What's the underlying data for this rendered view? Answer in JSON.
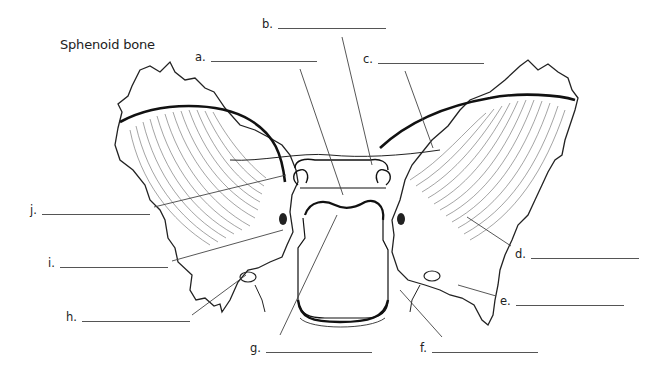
{
  "title": "Sphenoid bone",
  "labels": [
    {
      "id": "a",
      "text": "a.",
      "x": 195,
      "y": 50,
      "blank_width": 106
    },
    {
      "id": "b",
      "text": "b.",
      "x": 262,
      "y": 17,
      "blank_width": 108
    },
    {
      "id": "c",
      "text": "c.",
      "x": 363,
      "y": 52,
      "blank_width": 106
    },
    {
      "id": "d",
      "text": "d.",
      "x": 515,
      "y": 247,
      "blank_width": 108
    },
    {
      "id": "e",
      "text": "e.",
      "x": 500,
      "y": 294,
      "blank_width": 108
    },
    {
      "id": "f",
      "text": "f.",
      "x": 420,
      "y": 341,
      "blank_width": 106
    },
    {
      "id": "g",
      "text": "g.",
      "x": 250,
      "y": 341,
      "blank_width": 106
    },
    {
      "id": "h",
      "text": "h.",
      "x": 66,
      "y": 310,
      "blank_width": 108
    },
    {
      "id": "i",
      "text": "i.",
      "x": 48,
      "y": 256,
      "blank_width": 108
    },
    {
      "id": "j",
      "text": "j.",
      "x": 30,
      "y": 203,
      "blank_width": 108
    }
  ],
  "leader_lines": [
    {
      "label": "a",
      "x1": 300,
      "y1": 69,
      "x2": 343,
      "y2": 195
    },
    {
      "label": "b",
      "x1": 342,
      "y1": 37,
      "x2": 372,
      "y2": 165
    },
    {
      "label": "c",
      "x1": 405,
      "y1": 71,
      "x2": 433,
      "y2": 148
    },
    {
      "label": "d",
      "x1": 467,
      "y1": 217,
      "x2": 511,
      "y2": 246
    },
    {
      "label": "e",
      "x1": 458,
      "y1": 285,
      "x2": 496,
      "y2": 296
    },
    {
      "label": "f",
      "x1": 400,
      "y1": 290,
      "x2": 442,
      "y2": 337
    },
    {
      "label": "g",
      "x1": 337,
      "y1": 215,
      "x2": 280,
      "y2": 335
    },
    {
      "label": "h",
      "x1": 246,
      "y1": 275,
      "x2": 192,
      "y2": 315
    },
    {
      "label": "i",
      "x1": 283,
      "y1": 230,
      "x2": 172,
      "y2": 261
    },
    {
      "label": "j",
      "x1": 286,
      "y1": 175,
      "x2": 154,
      "y2": 207
    }
  ],
  "colors": {
    "line": "#222222",
    "leader": "#444444",
    "hatch": "#555555"
  }
}
